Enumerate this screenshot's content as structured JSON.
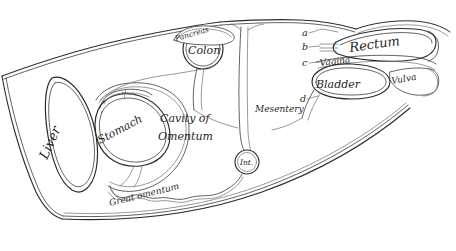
{
  "figure": {
    "background_color": "#ffffff",
    "ink_color": "#2b2b2b",
    "width": 456,
    "height": 251
  },
  "labels": {
    "liver": "Liver",
    "stomach": "Stomach",
    "pancreas": "Pancreas",
    "colon": "Colon",
    "cavity_line1": "Cavity of",
    "cavity_line2": "Omentum",
    "intestine": "Int.",
    "mesentery": "Mesentery",
    "great_omentum": "Great omentum",
    "rectum": "Rectum",
    "vagina": "Vagina",
    "bladder": "Bladder",
    "vulva": "Vulva"
  },
  "keys": {
    "a": "a",
    "b": "b",
    "c": "c",
    "d": "d"
  }
}
